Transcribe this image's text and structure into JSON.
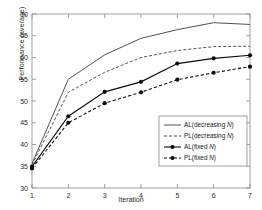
{
  "chart_data": {
    "type": "line",
    "title": "",
    "xlabel": "Iteration",
    "ylabel": "Performance (average)",
    "x": [
      1,
      2,
      3,
      4,
      5,
      6,
      7
    ],
    "xlim": [
      1,
      7
    ],
    "ylim": [
      30,
      70
    ],
    "xticks": [
      "1",
      "2",
      "3",
      "4",
      "5",
      "6",
      "7"
    ],
    "yticks": [
      "30",
      "35",
      "40",
      "45",
      "50",
      "55",
      "60",
      "65",
      "70"
    ],
    "grid": false,
    "legend_position": "lower right",
    "series": [
      {
        "name": "AL(decreasing N)",
        "label_prefix": "AL(decreasing ",
        "label_italic": "N",
        "label_suffix": ")",
        "style": "solid",
        "marker": "none",
        "color": "#3d3d3d",
        "values": [
          35.6,
          55.0,
          60.6,
          64.4,
          66.4,
          68.0,
          67.6
        ]
      },
      {
        "name": "PL(decreasing N)",
        "label_prefix": "PL(decreasing ",
        "label_italic": "N",
        "label_suffix": ")",
        "style": "dashed",
        "marker": "none",
        "color": "#3d3d3d",
        "values": [
          35.3,
          52.0,
          56.6,
          60.0,
          61.6,
          62.5,
          62.6
        ]
      },
      {
        "name": "AL(fixed N)",
        "label_prefix": "AL(fixed ",
        "label_italic": "N",
        "label_suffix": ")",
        "style": "solid",
        "marker": "circle",
        "color": "#0d0d0d",
        "values": [
          34.9,
          46.5,
          52.1,
          54.4,
          58.6,
          59.8,
          60.5
        ]
      },
      {
        "name": "PL(fixed N)",
        "label_prefix": "PL(fixed ",
        "label_italic": "N",
        "label_suffix": ")",
        "style": "dashed",
        "marker": "circle",
        "color": "#0d0d0d",
        "values": [
          34.5,
          45.0,
          49.5,
          52.0,
          54.9,
          56.5,
          57.9
        ]
      }
    ]
  }
}
